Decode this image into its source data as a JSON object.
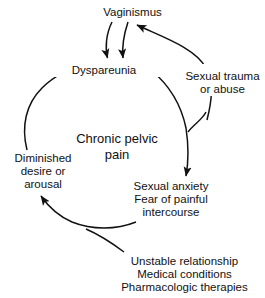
{
  "diagram": {
    "stroke_color": "#111111",
    "background_color": "#ffffff",
    "nodes": {
      "vaginismus": {
        "lines": [
          "Vaginismus"
        ]
      },
      "dyspareunia": {
        "lines": [
          "Dyspareunia"
        ]
      },
      "sexual_trauma": {
        "lines": [
          "Sexual trauma",
          "or abuse"
        ]
      },
      "chronic_pelvic_pain": {
        "lines": [
          "Chronic pelvic",
          "pain"
        ]
      },
      "diminished_desire": {
        "lines": [
          "Diminished",
          "desire or",
          "arousal"
        ]
      },
      "sexual_anxiety": {
        "lines": [
          "Sexual anxiety",
          "Fear of painful",
          "intercourse"
        ]
      },
      "contributing_factors": {
        "lines": [
          "Unstable relationship",
          "Medical conditions",
          "Pharmacologic therapies"
        ]
      }
    },
    "edges": [
      {
        "from": "vaginismus",
        "to": "dyspareunia",
        "arrow": "end"
      },
      {
        "from": "dyspareunia",
        "to": "vaginismus",
        "arrow": "end"
      },
      {
        "from": "sexual_trauma",
        "to": "vaginismus",
        "arrow": "end"
      },
      {
        "from": "dyspareunia",
        "to": "sexual_anxiety",
        "arrow": "end"
      },
      {
        "from": "sexual_trauma",
        "to": "sexual_anxiety",
        "arrow": "end"
      },
      {
        "from": "sexual_anxiety",
        "to": "diminished_desire",
        "arrow": "end"
      },
      {
        "from": "contributing_factors",
        "to": "diminished_desire",
        "arrow": "end"
      },
      {
        "from": "diminished_desire",
        "to": "dyspareunia",
        "arrow": "end"
      }
    ]
  }
}
